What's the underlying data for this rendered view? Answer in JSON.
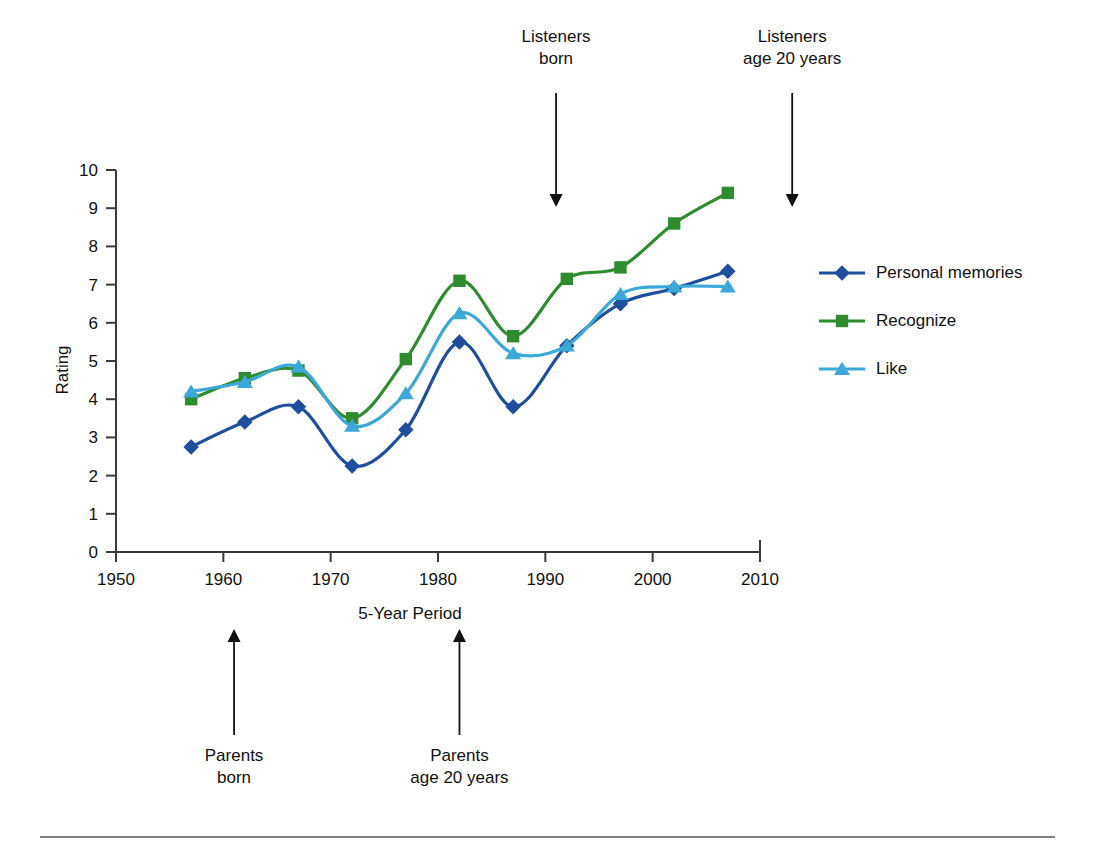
{
  "chart_data": {
    "type": "line",
    "title": "",
    "xlabel": "5-Year Period",
    "ylabel": "Rating",
    "xlim": [
      1950,
      2010
    ],
    "ylim": [
      0,
      10
    ],
    "xticks": [
      1950,
      1960,
      1970,
      1980,
      1990,
      2000,
      2010
    ],
    "yticks": [
      0,
      1,
      2,
      3,
      4,
      5,
      6,
      7,
      8,
      9,
      10
    ],
    "grid": false,
    "legend_position": "right",
    "x": [
      1957,
      1962,
      1967,
      1972,
      1977,
      1982,
      1987,
      1992,
      1997,
      2002,
      2007
    ],
    "series": [
      {
        "name": "Personal memories",
        "color": "#1F4E9C",
        "marker": "diamond",
        "values": [
          2.75,
          3.4,
          3.8,
          2.25,
          3.2,
          5.5,
          3.8,
          5.4,
          6.5,
          6.9,
          7.35
        ]
      },
      {
        "name": "Recognize",
        "color": "#2E8B2E",
        "marker": "square",
        "values": [
          4.0,
          4.55,
          4.75,
          3.5,
          5.05,
          7.1,
          5.65,
          7.15,
          7.45,
          8.6,
          9.4
        ]
      },
      {
        "name": "Like",
        "color": "#3CA8D8",
        "marker": "triangle",
        "values": [
          4.2,
          4.45,
          4.85,
          3.3,
          4.15,
          6.25,
          5.2,
          5.4,
          6.75,
          6.95,
          6.95
        ]
      }
    ],
    "annotations": [
      {
        "id": "listeners-born",
        "text_line1": "Listeners",
        "text_line2": "born",
        "at_year": 1991,
        "direction": "down"
      },
      {
        "id": "listeners-age-20",
        "text_line1": "Listeners",
        "text_line2": "age 20 years",
        "at_year": 2013,
        "direction": "down"
      },
      {
        "id": "parents-born",
        "text_line1": "Parents",
        "text_line2": "born",
        "at_year": 1961,
        "direction": "up"
      },
      {
        "id": "parents-age-20",
        "text_line1": "Parents",
        "text_line2": "age 20 years",
        "at_year": 1982,
        "direction": "up"
      }
    ]
  },
  "legend": {
    "items": [
      {
        "label": "Personal memories"
      },
      {
        "label": "Recognize"
      },
      {
        "label": "Like"
      }
    ]
  },
  "axis": {
    "x_title": "5-Year Period",
    "y_title": "Rating"
  }
}
